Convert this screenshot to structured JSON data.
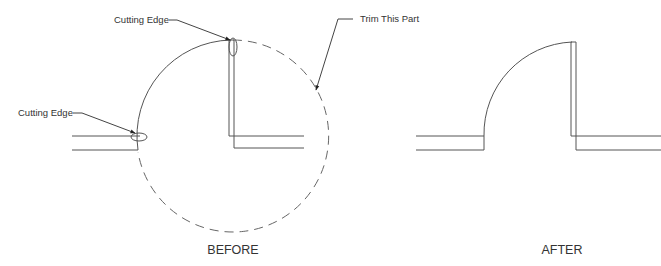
{
  "diagram": {
    "colors": {
      "line": "#555555",
      "dashed": "#666666",
      "text": "#333333",
      "background": "#ffffff"
    },
    "before": {
      "caption": "BEFORE",
      "callouts": {
        "cutting_edge_top": "Cutting Edge",
        "cutting_edge_left": "Cutting Edge",
        "trim_this_part": "Trim This Part"
      }
    },
    "after": {
      "caption": "AFTER"
    }
  }
}
